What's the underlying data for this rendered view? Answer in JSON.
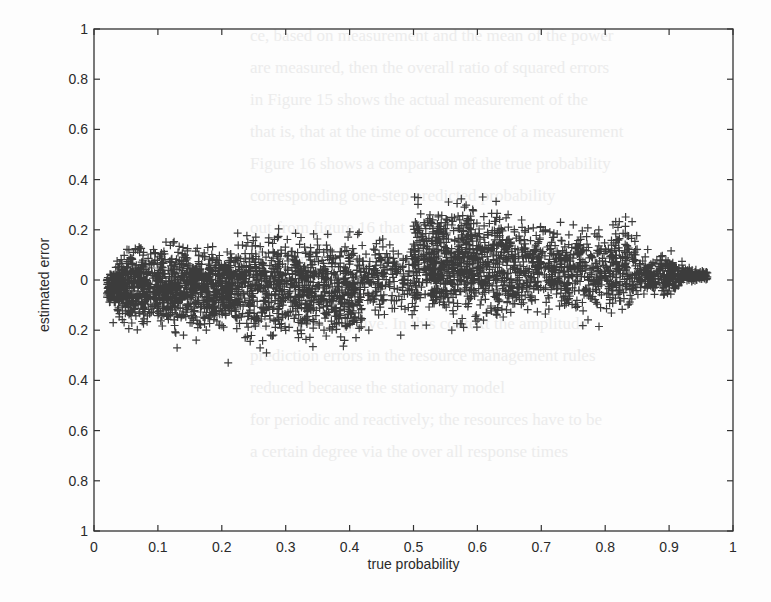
{
  "chart_data": {
    "type": "scatter",
    "title": "",
    "xlabel": "true probability",
    "ylabel": "estimated error",
    "xlim": [
      0,
      1
    ],
    "ylim": [
      -1,
      1
    ],
    "x_ticks": [
      "0",
      "0.1",
      "0.2",
      "0.3",
      "0.4",
      "0.5",
      "0.6",
      "0.7",
      "0.8",
      "0.9",
      "1"
    ],
    "y_ticks": [
      "1",
      "0.8",
      "0.6",
      "0.4",
      "0.2",
      "0",
      "0.2",
      "0.4",
      "0.6",
      "0.8",
      "1"
    ],
    "y_tick_values": [
      1,
      0.8,
      0.6,
      0.4,
      0.2,
      0,
      -0.2,
      -0.4,
      -0.6,
      -0.8,
      -1
    ],
    "marker": "+",
    "marker_color": "#1a1a1a",
    "grid": false,
    "legend": null,
    "clusters": [
      {
        "x_range": [
          0.02,
          0.22
        ],
        "center_y": -0.03,
        "spread_y": 0.07,
        "n": 1200
      },
      {
        "x_range": [
          0.22,
          0.42
        ],
        "center_y": -0.03,
        "spread_y": 0.09,
        "n": 900
      },
      {
        "x_range": [
          0.42,
          0.5
        ],
        "center_y": 0.01,
        "spread_y": 0.07,
        "n": 180
      },
      {
        "x_range": [
          0.5,
          0.65
        ],
        "center_y": 0.07,
        "spread_y": 0.1,
        "n": 800
      },
      {
        "x_range": [
          0.65,
          0.85
        ],
        "center_y": 0.04,
        "spread_y": 0.08,
        "n": 700
      },
      {
        "x_range": [
          0.85,
          0.96
        ],
        "center_y": 0.02,
        "spread_y": 0.035,
        "n": 350
      }
    ],
    "outliers": [
      [
        0.03,
        -0.17
      ],
      [
        0.13,
        -0.27
      ],
      [
        0.14,
        -0.22
      ],
      [
        0.16,
        -0.24
      ],
      [
        0.21,
        -0.33
      ],
      [
        0.26,
        -0.27
      ],
      [
        0.27,
        -0.29
      ],
      [
        0.32,
        -0.23
      ],
      [
        0.36,
        -0.2
      ],
      [
        0.41,
        -0.23
      ],
      [
        0.43,
        -0.2
      ],
      [
        0.48,
        -0.22
      ],
      [
        0.52,
        -0.18
      ],
      [
        0.56,
        -0.2
      ],
      [
        0.4,
        0.09
      ],
      [
        0.44,
        0.1
      ],
      [
        0.53,
        0.24
      ],
      [
        0.56,
        0.25
      ],
      [
        0.59,
        0.24
      ],
      [
        0.63,
        0.25
      ],
      [
        0.67,
        0.21
      ],
      [
        0.73,
        0.23
      ],
      [
        0.75,
        0.22
      ],
      [
        0.79,
        0.2
      ],
      [
        0.82,
        0.21
      ]
    ]
  },
  "background_text": [
    "ce, based on measurement and the mean of the power",
    "are measured, then the overall ratio of squared errors",
    "in Figure 15 shows the actual measurement of the",
    "that is, that at the time of occurrence of a measurement",
    "Figure 16 shows a comparison of the true probability",
    "corresponding one-step predicted probability",
    "out from figure 16 that at time",
    "allocating the actual resources",
    "the model in a way that the",
    "positive or negative. In this context the amplitude",
    "prediction errors in the resource management rules",
    "reduced because the stationary model",
    "for periodic and reactively; the resources have to be",
    "a certain degree via the over all response times"
  ]
}
